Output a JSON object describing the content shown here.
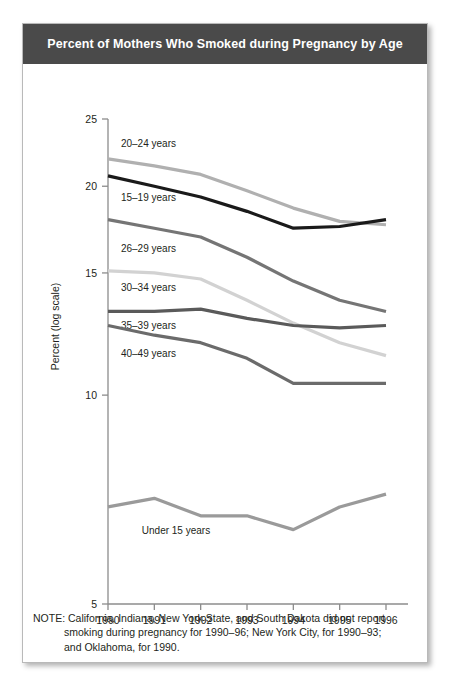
{
  "title": "Percent of Mothers Who Smoked during Pregnancy by Age",
  "note": {
    "line1": "NOTE: California, Indiana, New York State, and South Dakota did not report",
    "line2": "smoking during pregnancy for 1990–96; New York City, for 1990–93;",
    "line3": "and Oklahoma, for 1990."
  },
  "colors": {
    "title_bar": "#4a4a4a",
    "title_text": "#ffffff",
    "axis": "#8c8c8c",
    "text": "#231f20",
    "series_20_24": "#b0b0b0",
    "series_15_19": "#1a1a1a",
    "series_26_29": "#757575",
    "series_30_34": "#d2d2d2",
    "series_35_39": "#5a5a5a",
    "series_40_49": "#6b6b6b",
    "series_under_15": "#9a9a9a"
  },
  "chart_data": {
    "type": "line",
    "title": "Percent of Mothers Who Smoked during Pregnancy by Age",
    "xlabel": "",
    "ylabel": "Percent (log scale)",
    "yscale": "log",
    "ylim": [
      5,
      25
    ],
    "yticks": [
      5,
      10,
      15,
      20,
      25
    ],
    "ytick_labels": [
      "5",
      "10",
      "15",
      "20",
      "25"
    ],
    "x": [
      1990,
      1991,
      1992,
      1993,
      1994,
      1995,
      1996
    ],
    "xtick_labels": [
      "1990",
      "1991",
      "1992",
      "1993",
      "1994",
      "1995",
      "1996"
    ],
    "grid": false,
    "legend": "inline-labels",
    "series": [
      {
        "name": "20–24 years",
        "color": "#b0b0b0",
        "label_x": 1990.15,
        "label_y": 23.1,
        "values": [
          21.9,
          21.4,
          20.8,
          19.7,
          18.6,
          17.8,
          17.6
        ]
      },
      {
        "name": "15–19 years",
        "color": "#1a1a1a",
        "label_x": 1990.15,
        "label_y": 19.3,
        "values": [
          20.7,
          20.0,
          19.3,
          18.4,
          17.4,
          17.5,
          17.9
        ]
      },
      {
        "name": "26–29 years",
        "color": "#757575",
        "label_x": 1990.15,
        "label_y": 16.3,
        "values": [
          17.9,
          17.4,
          16.9,
          15.8,
          14.6,
          13.7,
          13.2
        ]
      },
      {
        "name": "30–34 years",
        "color": "#d2d2d2",
        "label_x": 1990.15,
        "label_y": 14.3,
        "values": [
          15.1,
          15.0,
          14.7,
          13.7,
          12.7,
          11.9,
          11.4
        ]
      },
      {
        "name": "35–39 years",
        "color": "#5a5a5a",
        "label_x": 1990.15,
        "label_y": 12.6,
        "values": [
          13.2,
          13.2,
          13.3,
          12.9,
          12.6,
          12.5,
          12.6
        ]
      },
      {
        "name": "40–49 years",
        "color": "#6b6b6b",
        "label_x": 1990.15,
        "label_y": 11.5,
        "values": [
          12.6,
          12.2,
          11.9,
          11.3,
          10.4,
          10.4,
          10.4
        ]
      },
      {
        "name": "Under 15 years",
        "color": "#9a9a9a",
        "label_x": 1990.6,
        "label_y": 6.4,
        "values": [
          6.9,
          7.1,
          6.7,
          6.7,
          6.4,
          6.9,
          7.2
        ]
      }
    ]
  }
}
